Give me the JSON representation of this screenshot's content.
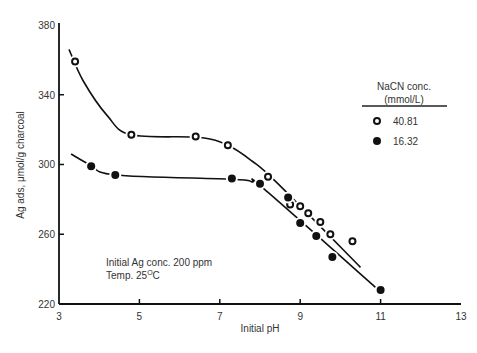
{
  "chart_data": {
    "type": "scatter",
    "title": "",
    "xlabel": "Initial pH",
    "ylabel": "Ag ads, μmol/g charcoal",
    "xlim": [
      3,
      13
    ],
    "ylim": [
      220,
      380
    ],
    "xticks": [
      3,
      5,
      7,
      9,
      11,
      13
    ],
    "yticks": [
      220,
      260,
      300,
      340,
      380
    ],
    "grid": false,
    "legend": {
      "title_line1": "NaCN conc.",
      "title_line2": "(mmol/L)",
      "position": "upper right"
    },
    "annotations": [
      "Initial Ag conc. 200 ppm",
      "Temp. 25°C"
    ],
    "series": [
      {
        "name": "40.81",
        "marker": "open-circle",
        "x": [
          3.4,
          4.8,
          6.4,
          7.2,
          8.2,
          8.75,
          9.0,
          9.2,
          9.5,
          9.75,
          10.3
        ],
        "y": [
          359,
          317,
          316,
          311,
          293,
          277,
          276,
          272,
          267,
          260,
          256
        ],
        "fit_line": [
          [
            3.25,
            366
          ],
          [
            3.6,
            348
          ],
          [
            4.2,
            328
          ],
          [
            4.8,
            317
          ],
          [
            6.5,
            315.5
          ],
          [
            7.2,
            311
          ],
          [
            7.8,
            302
          ],
          [
            8.4,
            290
          ],
          [
            10.5,
            241
          ]
        ]
      },
      {
        "name": "16.32",
        "marker": "filled-circle",
        "x": [
          3.8,
          4.4,
          7.3,
          8.0,
          8.7,
          9.0,
          9.4,
          9.8,
          11.0
        ],
        "y": [
          299,
          294,
          292,
          289,
          281,
          266.5,
          259,
          247,
          228
        ],
        "fit_line": [
          [
            3.3,
            306
          ],
          [
            3.8,
            299.5
          ],
          [
            4.4,
            294
          ],
          [
            7.3,
            291.5
          ],
          [
            7.8,
            290
          ],
          [
            8.1,
            286
          ],
          [
            11.0,
            227
          ]
        ]
      }
    ]
  }
}
